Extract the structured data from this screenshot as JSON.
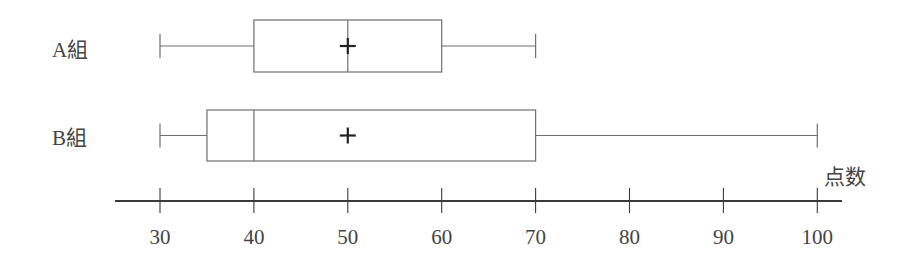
{
  "chart_data": {
    "type": "boxplot",
    "title": "",
    "xlabel": "点数",
    "ylabel": "",
    "xlim": [
      25,
      103
    ],
    "ticks": [
      30,
      40,
      50,
      60,
      70,
      80,
      90,
      100
    ],
    "tick_labels": [
      "30",
      "40",
      "50",
      "60",
      "70",
      "80",
      "90",
      "100"
    ],
    "grid": false,
    "legend": null,
    "series": [
      {
        "name": "A組",
        "min": 30,
        "q1": 40,
        "median": 50,
        "q3": 60,
        "max": 70,
        "mean": 50
      },
      {
        "name": "B組",
        "min": 30,
        "q1": 35,
        "median": 40,
        "q3": 70,
        "max": 100,
        "mean": 50
      }
    ]
  },
  "labels": {
    "group_a": "A組",
    "group_b": "B組",
    "axis_title": "点数"
  },
  "colors": {
    "box_line": "#6e6e6e",
    "axis_line": "#3a3a3a",
    "mean_marker": "#222222",
    "text": "#444444"
  }
}
